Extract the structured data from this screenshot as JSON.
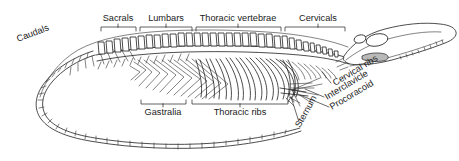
{
  "figure": {
    "background_color": "#ffffff",
    "line_color": "#202020",
    "text_color": "#1a1a1a",
    "width": 459,
    "height": 161
  },
  "top_labels": [
    {
      "id": "caudals",
      "text": "Caudals",
      "x": 18,
      "y": 42,
      "rotation": -21,
      "anchor": "start",
      "has_bracket": false
    },
    {
      "id": "sacrals",
      "text": "Sacrals",
      "x": 118,
      "y": 21,
      "rotation": 0,
      "anchor": "middle",
      "has_bracket": true
    },
    {
      "id": "lumbars",
      "text": "Lumbars",
      "x": 166,
      "y": 21,
      "rotation": 0,
      "anchor": "middle",
      "has_bracket": true
    },
    {
      "id": "thoracic-vertebrae",
      "text": "Thoracic vertebrae",
      "x": 238,
      "y": 21,
      "rotation": 0,
      "anchor": "middle",
      "has_bracket": true
    },
    {
      "id": "cervicals",
      "text": "Cervicals",
      "x": 318,
      "y": 21,
      "rotation": 0,
      "anchor": "middle",
      "has_bracket": true
    }
  ],
  "bottom_labels": [
    {
      "id": "gastralia",
      "text": "Gastralia",
      "x": 163,
      "y": 115,
      "rotation": 0,
      "anchor": "middle",
      "has_bracket": true
    },
    {
      "id": "thoracic-ribs",
      "text": "Thoracic ribs",
      "x": 240,
      "y": 115,
      "rotation": 0,
      "anchor": "middle",
      "has_bracket": true
    }
  ],
  "leader_labels": [
    {
      "id": "cervical-ribs",
      "text": "Cervical ribs",
      "x": 335,
      "y": 86,
      "rotation": -31,
      "anchor": "start"
    },
    {
      "id": "interclavicle",
      "text": "Interclavicle",
      "x": 327,
      "y": 100,
      "rotation": -31,
      "anchor": "start"
    },
    {
      "id": "procoracoid",
      "text": "Procoracoid",
      "x": 332,
      "y": 110,
      "rotation": -31,
      "anchor": "start"
    },
    {
      "id": "sternum",
      "text": "Sternum",
      "x": 300,
      "y": 128,
      "rotation": -61,
      "anchor": "start"
    }
  ],
  "brackets": {
    "sacrals": {
      "x1": 101,
      "x2": 136,
      "y": 26,
      "tick_x": 118,
      "direction": "down"
    },
    "lumbars": {
      "x1": 140,
      "x2": 192,
      "y": 26,
      "tick_x": 166,
      "direction": "down"
    },
    "thoracic_vertebrae": {
      "x1": 196,
      "x2": 281,
      "y": 26,
      "tick_x": 238,
      "direction": "down"
    },
    "cervicals": {
      "x1": 285,
      "x2": 345,
      "y": 26,
      "tick_x": 318,
      "direction": "down"
    },
    "gastralia": {
      "x1": 141,
      "x2": 186,
      "y": 104,
      "tick_x": 163,
      "direction": "up"
    },
    "thoracic_ribs": {
      "x1": 192,
      "x2": 288,
      "y": 104,
      "tick_x": 240,
      "direction": "up"
    }
  },
  "skeleton_parts": [
    {
      "id": "skull",
      "name": "skull"
    },
    {
      "id": "vertebral-column",
      "name": "vertebral column"
    },
    {
      "id": "neural-spines",
      "name": "neural spines"
    },
    {
      "id": "ribs",
      "name": "ribs"
    },
    {
      "id": "gastralia-bones",
      "name": "gastralia"
    },
    {
      "id": "pectoral-girdle",
      "name": "pectoral girdle"
    },
    {
      "id": "tail",
      "name": "tail"
    }
  ]
}
